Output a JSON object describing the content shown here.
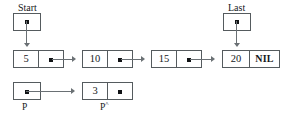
{
  "diagram": {
    "colors": {
      "background": "#ffffff",
      "box_border": "#555b5e",
      "line": "#6a7074",
      "text": "#16181a",
      "dot": "#111315"
    },
    "pointers": {
      "start": {
        "label": "Start",
        "dot": "pointer-dot"
      },
      "last": {
        "label": "Last",
        "dot": "pointer-dot"
      },
      "p": {
        "label": "P",
        "dot": "pointer-dot"
      },
      "p_deref": {
        "label": "P",
        "superscript": "^"
      }
    },
    "list_nodes": [
      {
        "data": "5",
        "next": "pointer-dot"
      },
      {
        "data": "10",
        "next": "pointer-dot"
      },
      {
        "data": "15",
        "next": "pointer-dot"
      },
      {
        "data": "20",
        "next": "NIL"
      }
    ],
    "detached_node": {
      "data": "3",
      "next": "pointer-dot"
    }
  }
}
